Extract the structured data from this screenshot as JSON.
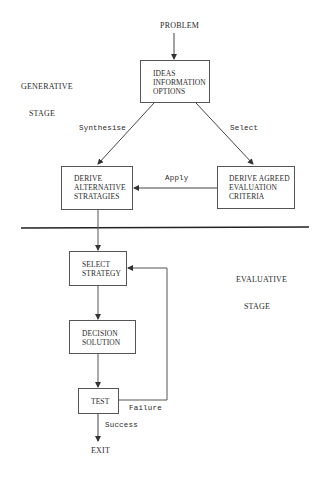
{
  "diagram": {
    "type": "flowchart",
    "input_label": "PROBLEM",
    "stages": {
      "generative": [
        "GENERATIVE",
        "STAGE"
      ],
      "evaluative": [
        "EVALUATIVE",
        "STAGE"
      ]
    },
    "nodes": {
      "ideas": [
        "IDEAS",
        "INFORMATION",
        "OPTIONS"
      ],
      "derive_alternative": [
        "DERIVE",
        "ALTERNATIVE",
        "STRATAGIES"
      ],
      "derive_agreed": [
        "DERIVE AGREED",
        "EVALUATION",
        "CRITERIA"
      ],
      "select_strategy": [
        "SELECT",
        "STRATEGY"
      ],
      "decision_solution": [
        "DECISION",
        "SOLUTION"
      ],
      "test": [
        "TEST"
      ]
    },
    "edges": {
      "synthesise": "Synthesise",
      "select": "Select",
      "apply": "Apply",
      "failure": "Failure",
      "success": "Success"
    },
    "output_label": "EXIT"
  }
}
